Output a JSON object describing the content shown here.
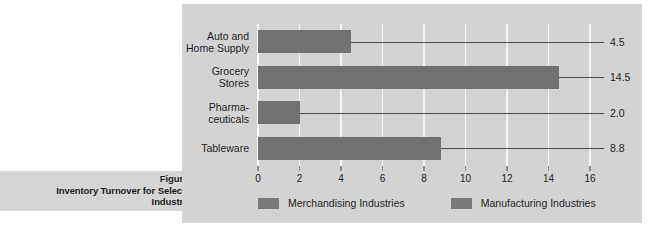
{
  "caption": {
    "figure_number": "Figure 2",
    "title_line_1": "Inventory Turnover for Selected",
    "title_line_2": "Industries"
  },
  "chart_data": {
    "type": "bar",
    "orientation": "horizontal",
    "title": "Inventory Turnover for Selected Industries",
    "xlabel": "",
    "ylabel": "",
    "xlim": [
      0,
      16
    ],
    "grid": true,
    "xticks": [
      "0",
      "2",
      "4",
      "6",
      "8",
      "10",
      "12",
      "14",
      "16"
    ],
    "xtick_values": [
      0,
      2,
      4,
      6,
      8,
      10,
      12,
      14,
      16
    ],
    "categories": [
      "Auto and Home Supply",
      "Grocery Stores",
      "Pharmaceuticals",
      "Tableware"
    ],
    "values": [
      4.5,
      14.5,
      2.0,
      8.8
    ],
    "value_labels": [
      "4.5",
      "14.5",
      "2.0",
      "8.8"
    ],
    "bars": [
      {
        "category": "Auto and Home Supply",
        "label_lines": [
          "Auto and",
          "Home Supply"
        ],
        "value": 4.5,
        "value_label": "4.5",
        "series": "Merchandising Industries"
      },
      {
        "category": "Grocery Stores",
        "label_lines": [
          "Grocery",
          "Stores"
        ],
        "value": 14.5,
        "value_label": "14.5",
        "series": "Merchandising Industries"
      },
      {
        "category": "Pharmaceuticals",
        "label_lines": [
          "Pharma-",
          "ceuticals"
        ],
        "value": 2.0,
        "value_label": "2.0",
        "series": "Manufacturing Industries"
      },
      {
        "category": "Tableware",
        "label_lines": [
          "Tableware"
        ],
        "value": 8.8,
        "value_label": "8.8",
        "series": "Manufacturing Industries"
      }
    ],
    "legend": {
      "position": "bottom",
      "entries": [
        {
          "name": "Merchandising Industries",
          "color": "#7a7a7a"
        },
        {
          "name": "Manufacturing Industries",
          "color": "#7a7a7a"
        }
      ]
    },
    "colors": {
      "bar": "#717171",
      "panel_background": "#d3d3d3",
      "caption_band": "#d5d5d5",
      "gridline": "#f2f2f2",
      "leader_line": "#4a4a4a",
      "text": "#1e1e1e"
    }
  }
}
